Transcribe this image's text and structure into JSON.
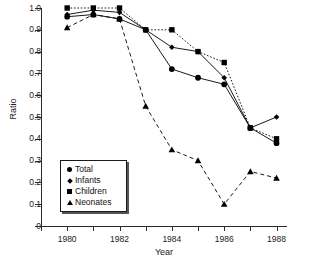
{
  "chart_data": {
    "type": "line",
    "title": "",
    "xlabel": "Year",
    "ylabel": "Ratio",
    "x": [
      1980,
      1981,
      1982,
      1983,
      1984,
      1985,
      1986,
      1987,
      1988
    ],
    "xlim": [
      1979,
      1988.4
    ],
    "ylim": [
      0,
      1.0
    ],
    "grid": false,
    "legend_position": "lower-left-inside",
    "x_tick_labels": [
      "1980",
      "1982",
      "1984",
      "1986",
      "1988"
    ],
    "x_tick_values": [
      1980,
      1982,
      1984,
      1986,
      1988
    ],
    "x_minor_tick_values": [
      1979,
      1981,
      1983,
      1985,
      1987
    ],
    "y_tick_labels": [
      "0",
      "0.1",
      "0.2",
      "0.3",
      "0.4",
      "0.5",
      "0.6",
      "0.7",
      "0.8",
      "0.9",
      "1.0"
    ],
    "y_tick_values": [
      0,
      0.1,
      0.2,
      0.3,
      0.4,
      0.5,
      0.6,
      0.7,
      0.8,
      0.9,
      1.0
    ],
    "series": [
      {
        "name": "Total",
        "marker": "circle",
        "linestyle": "solid",
        "color": "#000000",
        "values": [
          0.96,
          0.97,
          0.95,
          0.9,
          0.72,
          0.68,
          0.65,
          0.45,
          0.38
        ]
      },
      {
        "name": "Infants",
        "marker": "diamond",
        "linestyle": "solid",
        "color": "#000000",
        "values": [
          0.97,
          0.99,
          0.98,
          0.9,
          0.82,
          0.8,
          0.68,
          0.45,
          0.5
        ]
      },
      {
        "name": "Children",
        "marker": "square",
        "linestyle": "dotted",
        "color": "#000000",
        "values": [
          1.0,
          1.0,
          1.0,
          0.9,
          0.9,
          0.8,
          0.75,
          0.45,
          0.4
        ]
      },
      {
        "name": "Neonates",
        "marker": "triangle",
        "linestyle": "dashed",
        "color": "#000000",
        "values": [
          0.91,
          0.97,
          0.95,
          0.55,
          0.35,
          0.3,
          0.1,
          0.25,
          0.22
        ]
      }
    ]
  },
  "legend": {
    "items": [
      {
        "label": "Total",
        "marker": "circle"
      },
      {
        "label": "Infants",
        "marker": "diamond"
      },
      {
        "label": "Children",
        "marker": "square"
      },
      {
        "label": "Neonates",
        "marker": "triangle"
      }
    ]
  }
}
